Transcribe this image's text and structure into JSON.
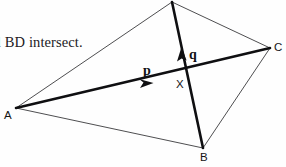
{
  "figure": {
    "caption": "l BD intersect.",
    "background_color": "#fefefe",
    "stroke_color_thin": "#3a3a3c",
    "stroke_color_bold": "#0f0f11",
    "width": 286,
    "height": 167,
    "vertices": {
      "A": {
        "label": "A",
        "x": 16,
        "y": 108
      },
      "B": {
        "label": "B",
        "x": 203,
        "y": 148
      },
      "C": {
        "label": "C",
        "x": 270,
        "y": 48
      },
      "D": {
        "label": "",
        "x": 172,
        "y": 2
      },
      "X": {
        "label": "X",
        "x": 189,
        "y": 78
      }
    },
    "edges": [
      {
        "name": "edge-A-D",
        "from": "A",
        "to": "D",
        "style": "thin"
      },
      {
        "name": "edge-D-C",
        "from": "D",
        "to": "C",
        "style": "thin"
      },
      {
        "name": "edge-C-B",
        "from": "C",
        "to": "B",
        "style": "thin"
      },
      {
        "name": "edge-B-A",
        "from": "B",
        "to": "A",
        "style": "thin"
      }
    ],
    "vectors": [
      {
        "name": "vector-p",
        "label": "p",
        "from": "A",
        "to": "C",
        "style": "bold",
        "arrow_x": 150,
        "arrow_y": 84,
        "label_x": 147,
        "label_y": 72
      },
      {
        "name": "vector-q",
        "label": "q",
        "from": "B",
        "to": "D",
        "style": "bold",
        "arrow_x": 183,
        "arrow_y": 50,
        "label_x": 192,
        "label_y": 55
      }
    ]
  }
}
